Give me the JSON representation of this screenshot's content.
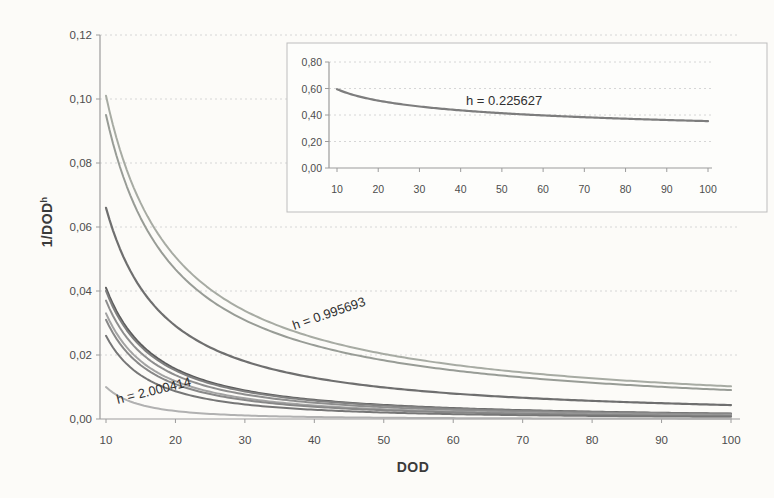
{
  "figure": {
    "xlabel": "DOD",
    "ylabel_base": "1/DOD",
    "ylabel_sup": "h",
    "background_color": "#fcfbf8",
    "grid_color": "#d6d6d6",
    "axis_color": "#9c9c9c",
    "inset_border_color": "#bdbdbd",
    "inset_fill_color": "#fdfdfb"
  },
  "chart_data": [
    {
      "id": "main",
      "type": "line",
      "title": "",
      "xlabel": "DOD",
      "ylabel": "1/DOD^h",
      "xlim": [
        10,
        100
      ],
      "ylim": [
        0,
        0.12
      ],
      "grid": "horizontal-dashed",
      "legend": "none",
      "x_ticks": [
        10,
        20,
        30,
        40,
        50,
        60,
        70,
        80,
        90,
        100
      ],
      "x_tick_labels": [
        "10",
        "20",
        "30",
        "40",
        "50",
        "60",
        "70",
        "80",
        "90",
        "100"
      ],
      "y_ticks": [
        0,
        0.02,
        0.04,
        0.06,
        0.08,
        0.1,
        0.12
      ],
      "y_tick_labels": [
        "0,00",
        "0,02",
        "0,04",
        "0,06",
        "0,08",
        "0,10",
        "0,12"
      ],
      "x": [
        10,
        20,
        30,
        40,
        50,
        60,
        70,
        80,
        90,
        100
      ],
      "series": [
        {
          "name": "h = 0.995693",
          "h": 0.995693,
          "color": "#a7aba3",
          "width": 2,
          "values": [
            0.101,
            0.0507,
            0.0338,
            0.0254,
            0.0204,
            0.017,
            0.0146,
            0.0127,
            0.0113,
            0.0102
          ]
        },
        {
          "name": "h ≈ 1.022",
          "h": 1.0223,
          "color": "#989c96",
          "width": 2,
          "values": [
            0.095,
            0.0468,
            0.0309,
            0.023,
            0.0183,
            0.0152,
            0.013,
            0.0113,
            0.01,
            0.009
          ]
        },
        {
          "name": "h ≈ 1.181",
          "h": 1.1805,
          "color": "#6f6f6f",
          "width": 2.2,
          "values": [
            0.066,
            0.0291,
            0.0181,
            0.0128,
            0.0099,
            0.008,
            0.0066,
            0.0057,
            0.0049,
            0.0044
          ]
        },
        {
          "name": "h ≈ 1.387",
          "h": 1.3872,
          "color": "#5c5c5c",
          "width": 2,
          "values": [
            0.041,
            0.0157,
            0.0089,
            0.006,
            0.0044,
            0.0034,
            0.0028,
            0.0023,
            0.0019,
            0.0017
          ]
        },
        {
          "name": "h ≈ 1.398",
          "h": 1.3979,
          "color": "#808080",
          "width": 2,
          "values": [
            0.04,
            0.0152,
            0.0086,
            0.0058,
            0.0042,
            0.0033,
            0.0026,
            0.0022,
            0.0019,
            0.0016
          ]
        },
        {
          "name": "h ≈ 1.432",
          "h": 1.4318,
          "color": "#8e8e8e",
          "width": 2,
          "values": [
            0.037,
            0.0137,
            0.0077,
            0.0051,
            0.0037,
            0.0028,
            0.0023,
            0.0019,
            0.0016,
            0.0014
          ]
        },
        {
          "name": "h ≈ 1.481",
          "h": 1.4815,
          "color": "#a3a3a3",
          "width": 2,
          "values": [
            0.033,
            0.0118,
            0.0065,
            0.0042,
            0.003,
            0.0023,
            0.0018,
            0.0015,
            0.0013,
            0.0011
          ]
        },
        {
          "name": "h ≈ 1.509",
          "h": 1.5086,
          "color": "#888888",
          "width": 2,
          "values": [
            0.031,
            0.0109,
            0.0059,
            0.0038,
            0.0027,
            0.0021,
            0.0016,
            0.0013,
            0.0011,
            0.001
          ]
        },
        {
          "name": "h ≈ 1.585",
          "h": 1.585,
          "color": "#767676",
          "width": 2,
          "values": [
            0.026,
            0.0087,
            0.0046,
            0.0029,
            0.002,
            0.0015,
            0.0012,
            0.001,
            0.0008,
            0.0007
          ]
        },
        {
          "name": "h = 2.000414",
          "h": 2.000414,
          "color": "#b1b1b1",
          "width": 2,
          "values": [
            0.01,
            0.0025,
            0.0011,
            0.0006,
            0.0004,
            0.0003,
            0.0002,
            0.0002,
            0.0001,
            0.0001
          ]
        }
      ],
      "annotations": [
        {
          "text": "h = 0.995693",
          "dod": 37.1,
          "v": 0.0278,
          "rotate": -19
        },
        {
          "text": "h = 2.000414",
          "dod": 11.7,
          "v": 0.0047,
          "rotate": -14
        }
      ]
    },
    {
      "id": "inset",
      "type": "line",
      "title": "",
      "xlim": [
        10,
        100
      ],
      "ylim": [
        0,
        0.8
      ],
      "grid": "horizontal-dashed",
      "legend": "none",
      "x_ticks": [
        10,
        20,
        30,
        40,
        50,
        60,
        70,
        80,
        90,
        100
      ],
      "x_tick_labels": [
        "10",
        "20",
        "30",
        "40",
        "50",
        "60",
        "70",
        "80",
        "90",
        "100"
      ],
      "y_ticks": [
        0,
        0.2,
        0.4,
        0.6,
        0.8
      ],
      "y_tick_labels": [
        "0,00",
        "0,20",
        "0,40",
        "0,60",
        "0,80"
      ],
      "x": [
        10,
        20,
        30,
        40,
        50,
        60,
        70,
        80,
        90,
        100
      ],
      "series": [
        {
          "name": "h = 0.225627",
          "h": 0.225627,
          "color": "#7d7d7d",
          "width": 2.2,
          "values": [
            0.595,
            0.509,
            0.464,
            0.434,
            0.413,
            0.396,
            0.383,
            0.371,
            0.362,
            0.354
          ]
        }
      ],
      "annotations": [
        {
          "text": "h = 0.225627",
          "dod": 41.3,
          "v": 0.475,
          "rotate": 0
        }
      ]
    }
  ]
}
